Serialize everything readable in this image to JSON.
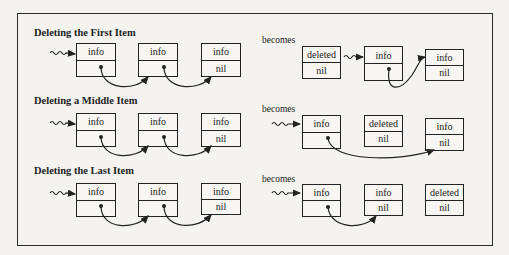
{
  "diagram": {
    "sections": [
      {
        "title": "Deleting the First Item",
        "becomes_label": "becomes",
        "before": {
          "nodes": [
            {
              "info": "info",
              "link": ""
            },
            {
              "info": "info",
              "link": ""
            },
            {
              "info": "info",
              "link": "nil"
            }
          ],
          "head_pointer_to": 0,
          "links": [
            [
              0,
              1
            ],
            [
              1,
              2
            ]
          ]
        },
        "after": {
          "nodes": [
            {
              "info": "deleted",
              "link": "nil"
            },
            {
              "info": "info",
              "link": ""
            },
            {
              "info": "info",
              "link": "nil"
            }
          ],
          "head_pointer_to": 1,
          "links": [
            [
              1,
              2
            ]
          ]
        }
      },
      {
        "title": "Deleting a Middle Item",
        "becomes_label": "becomes",
        "before": {
          "nodes": [
            {
              "info": "info",
              "link": ""
            },
            {
              "info": "info",
              "link": ""
            },
            {
              "info": "info",
              "link": "nil"
            }
          ],
          "head_pointer_to": 0,
          "links": [
            [
              0,
              1
            ],
            [
              1,
              2
            ]
          ]
        },
        "after": {
          "nodes": [
            {
              "info": "info",
              "link": ""
            },
            {
              "info": "deleted",
              "link": "nil"
            },
            {
              "info": "info",
              "link": "nil"
            }
          ],
          "head_pointer_to": 0,
          "links": [
            [
              0,
              2
            ]
          ]
        }
      },
      {
        "title": "Deleting the Last Item",
        "becomes_label": "becomes",
        "before": {
          "nodes": [
            {
              "info": "info",
              "link": ""
            },
            {
              "info": "info",
              "link": ""
            },
            {
              "info": "info",
              "link": "nil"
            }
          ],
          "head_pointer_to": 0,
          "links": [
            [
              0,
              1
            ],
            [
              1,
              2
            ]
          ]
        },
        "after": {
          "nodes": [
            {
              "info": "info",
              "link": ""
            },
            {
              "info": "info",
              "link": "nil"
            },
            {
              "info": "deleted",
              "link": "nil"
            }
          ],
          "head_pointer_to": 0,
          "links": [
            [
              0,
              1
            ]
          ]
        }
      }
    ],
    "colors": {
      "line": "#222222",
      "background": "#f4f3f0"
    }
  }
}
